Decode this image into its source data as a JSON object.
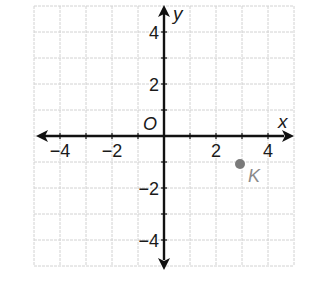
{
  "chart_data": {
    "type": "scatter",
    "title": "",
    "xlabel": "x",
    "ylabel": "y",
    "origin_label": "O",
    "xlim": [
      -5,
      5
    ],
    "ylim": [
      -5,
      5
    ],
    "grid": true,
    "x_ticks": [
      -4,
      -2,
      2,
      4
    ],
    "y_ticks": [
      4,
      2,
      -2,
      -4
    ],
    "x_tick_labels": [
      "−4",
      "−2",
      "2",
      "4"
    ],
    "y_tick_labels": [
      "4",
      "2",
      "−2",
      "−4"
    ],
    "points": [
      {
        "label": "K",
        "x": 3,
        "y": -1
      }
    ]
  },
  "colors": {
    "axis": "#111111",
    "grid": "#d2d2d2",
    "point": "#7a7a7a",
    "point_label": "#8a8a8a"
  }
}
